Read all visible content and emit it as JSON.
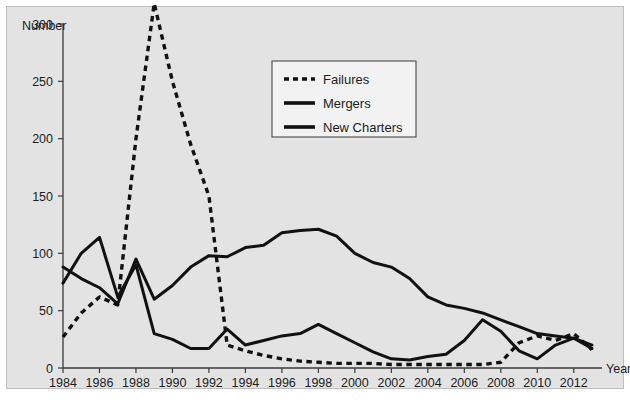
{
  "figure": {
    "background_color": "#e3e3e3",
    "page_background_color": "#ffffff",
    "line_color": "#111111"
  },
  "chart_data": {
    "type": "line",
    "title": "",
    "subtitle": "",
    "xlabel": "Year",
    "ylabel": "Number",
    "xlim": [
      1984,
      2013
    ],
    "ylim": [
      0,
      300
    ],
    "grid": false,
    "legend_position": "top-center-right",
    "x_tick_labels": [
      "1984",
      "1986",
      "1988",
      "1990",
      "1992",
      "1994",
      "1996",
      "1998",
      "2000",
      "2002",
      "2004",
      "2006",
      "2008",
      "2010",
      "2012"
    ],
    "y_tick_labels": [
      "0",
      "50",
      "100",
      "150",
      "200",
      "250",
      "300"
    ],
    "x_ticks": [
      1984,
      1986,
      1988,
      1990,
      1992,
      1994,
      1996,
      1998,
      2000,
      2002,
      2004,
      2006,
      2008,
      2010,
      2012
    ],
    "y_ticks": [
      0,
      50,
      100,
      150,
      200,
      250,
      300
    ],
    "x": [
      1984,
      1985,
      1986,
      1987,
      1988,
      1989,
      1990,
      1991,
      1992,
      1993,
      1994,
      1995,
      1996,
      1997,
      1998,
      1999,
      2000,
      2001,
      2002,
      2003,
      2004,
      2005,
      2006,
      2007,
      2008,
      2009,
      2010,
      2011,
      2012,
      2013
    ],
    "series": [
      {
        "name": "Failures",
        "style": "dotted",
        "values": [
          27,
          48,
          62,
          55,
          200,
          318,
          250,
          195,
          150,
          20,
          15,
          11,
          8,
          6,
          5,
          4,
          4,
          4,
          3,
          3,
          3,
          3,
          3,
          3,
          5,
          22,
          28,
          24,
          30,
          16
        ]
      },
      {
        "name": "Mergers",
        "style": "solid",
        "values": [
          88,
          78,
          70,
          56,
          95,
          60,
          72,
          88,
          98,
          97,
          105,
          107,
          118,
          120,
          121,
          115,
          100,
          92,
          88,
          78,
          62,
          55,
          52,
          48,
          42,
          36,
          30,
          28,
          26,
          20
        ]
      },
      {
        "name": "New Charters",
        "style": "solid",
        "values": [
          74,
          100,
          114,
          62,
          90,
          30,
          25,
          17,
          17,
          34,
          20,
          24,
          28,
          30,
          38,
          30,
          22,
          14,
          8,
          7,
          10,
          12,
          24,
          42,
          32,
          15,
          8,
          20,
          26,
          17
        ]
      }
    ]
  },
  "legend": {
    "items": [
      {
        "label": "Failures",
        "style": "dotted"
      },
      {
        "label": "Mergers",
        "style": "solid"
      },
      {
        "label": "New Charters",
        "style": "solid"
      }
    ]
  },
  "axis": {
    "y_title": "Number",
    "x_title": "Year"
  }
}
